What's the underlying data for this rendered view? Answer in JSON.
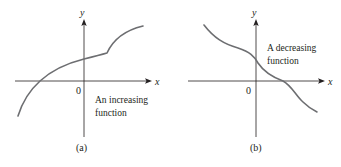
{
  "figure": {
    "panels": [
      {
        "id": "a",
        "caption": "(a)",
        "x_axis_label": "x",
        "y_axis_label": "y",
        "origin_label": "0",
        "annotation": [
          "An increasing",
          "function"
        ],
        "curve_description": "increasing curve crossing x-axis left of origin, with a corner/kink to the right of the y-axis where it turns upward more steeply"
      },
      {
        "id": "b",
        "caption": "(b)",
        "x_axis_label": "x",
        "y_axis_label": "y",
        "origin_label": "0",
        "annotation": [
          "A decreasing",
          "function"
        ],
        "curve_description": "smooth decreasing curve from upper-left to lower-right, crossing x-axis right of origin"
      }
    ],
    "colors": {
      "axis": "#231f20",
      "curve": "#6d6e71",
      "background": "#ffffff"
    }
  }
}
